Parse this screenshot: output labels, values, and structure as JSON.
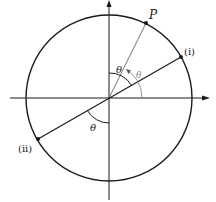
{
  "diagram": {
    "title": "",
    "labels": {
      "point_p": "P",
      "point_i": "(i)",
      "point_ii": "(ii)",
      "theta_upper": "θ",
      "theta_arrow": "θ",
      "theta_lower": "θ"
    },
    "colors": {
      "stroke": "#1a1a1a",
      "arrow_gray": "#777777",
      "background": "#ffffff"
    },
    "geometry": {
      "center": [
        109,
        98
      ],
      "radius": 83,
      "point_p": [
        146,
        23
      ],
      "point_i": [
        181,
        57
      ],
      "point_ii": [
        38,
        139
      ]
    }
  }
}
